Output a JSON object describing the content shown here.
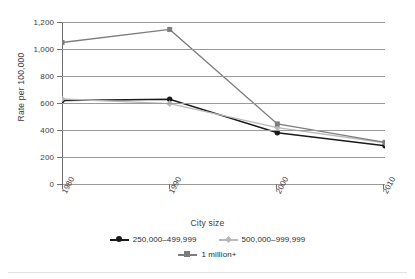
{
  "chart_data": {
    "type": "line",
    "title": "",
    "xlabel": "City size",
    "ylabel": "Rate per 100,000",
    "categories": [
      "1980",
      "1990",
      "2000",
      "2010"
    ],
    "ylim": [
      0,
      1200
    ],
    "yticks": [
      "0",
      "200",
      "400",
      "600",
      "800",
      "1,000",
      "1,200"
    ],
    "ytick_values": [
      0,
      200,
      400,
      600,
      800,
      1000,
      1200
    ],
    "grid": "horizontal",
    "legend_position": "bottom",
    "series": [
      {
        "name": "250,000–499,999",
        "values": [
          618,
          628,
          380,
          283
        ],
        "color": "#1a1a1a",
        "marker": "circle"
      },
      {
        "name": "500,000–999,999",
        "values": [
          630,
          595,
          418,
          305
        ],
        "color": "#b9b9b9",
        "marker": "diamond"
      },
      {
        "name": "1 million+",
        "values": [
          1048,
          1145,
          445,
          308
        ],
        "color": "#7d7d7d",
        "marker": "square"
      }
    ]
  },
  "axes": {
    "y_title": "Rate per 100,000",
    "x_title": "City size"
  },
  "legend": {
    "rows": [
      [
        {
          "label": "250,000–499,999",
          "color": "#1a1a1a",
          "marker": "circle"
        },
        {
          "label": "500,000–999,999",
          "color": "#b9b9b9",
          "marker": "diamond"
        }
      ],
      [
        {
          "label": "1 million+",
          "color": "#7d7d7d",
          "marker": "square"
        }
      ]
    ]
  },
  "colors": {
    "grid": "#9a9a9a",
    "axis": "#6e6e6e",
    "text": "#3b3b3b",
    "background": "#ffffff"
  }
}
